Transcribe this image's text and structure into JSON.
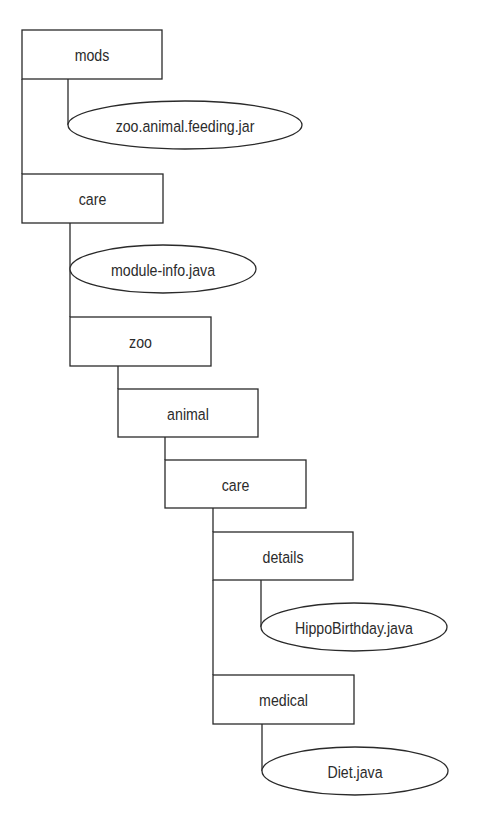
{
  "diagram": {
    "type": "directory-tree",
    "colors": {
      "stroke": "#2a2a2a",
      "text": "#2b2b2b",
      "background": "#ffffff"
    },
    "nodes": [
      {
        "id": "mods",
        "kind": "directory",
        "label": "mods",
        "x": 22,
        "y": 30,
        "w": 140,
        "h": 49
      },
      {
        "id": "zoo-animal-feeding-jar",
        "kind": "file",
        "label": "zoo.animal.feeding.jar",
        "cx": 185,
        "cy": 125,
        "rx": 117,
        "ry": 24
      },
      {
        "id": "care-root",
        "kind": "directory",
        "label": "care",
        "x": 22,
        "y": 174,
        "w": 141,
        "h": 49
      },
      {
        "id": "module-info-java",
        "kind": "file",
        "label": "module-info.java",
        "cx": 163,
        "cy": 269,
        "rx": 93,
        "ry": 24
      },
      {
        "id": "zoo",
        "kind": "directory",
        "label": "zoo",
        "x": 70,
        "y": 317,
        "w": 141,
        "h": 49
      },
      {
        "id": "animal",
        "kind": "directory",
        "label": "animal",
        "x": 118,
        "y": 389,
        "w": 140,
        "h": 48
      },
      {
        "id": "care-inner",
        "kind": "directory",
        "label": "care",
        "x": 165,
        "y": 460,
        "w": 141,
        "h": 48
      },
      {
        "id": "details",
        "kind": "directory",
        "label": "details",
        "x": 213,
        "y": 532,
        "w": 140,
        "h": 48
      },
      {
        "id": "hippo-birthday-java",
        "kind": "file",
        "label": "HippoBirthday.java",
        "cx": 354,
        "cy": 627,
        "rx": 93,
        "ry": 24
      },
      {
        "id": "medical",
        "kind": "directory",
        "label": "medical",
        "x": 213,
        "y": 675,
        "w": 141,
        "h": 49
      },
      {
        "id": "diet-java",
        "kind": "file",
        "label": "Diet.java",
        "cx": 355,
        "cy": 771,
        "rx": 93,
        "ry": 24
      }
    ],
    "edges": [
      {
        "from": "mods",
        "to": "care-root",
        "points": [
          [
            22,
            79
          ],
          [
            22,
            174
          ]
        ]
      },
      {
        "from": "mods",
        "to": "zoo-animal-feeding-jar",
        "points": [
          [
            68,
            79
          ],
          [
            68,
            125
          ]
        ]
      },
      {
        "from": "care-root",
        "to": "module-info-java",
        "points": [
          [
            70,
            223
          ],
          [
            70,
            269
          ]
        ]
      },
      {
        "from": "care-root",
        "to": "zoo",
        "points": [
          [
            70,
            269
          ],
          [
            70,
            317
          ]
        ]
      },
      {
        "from": "zoo",
        "to": "animal",
        "points": [
          [
            118,
            366
          ],
          [
            118,
            389
          ]
        ]
      },
      {
        "from": "animal",
        "to": "care-inner",
        "points": [
          [
            165,
            437
          ],
          [
            165,
            460
          ]
        ]
      },
      {
        "from": "care-inner",
        "to": "details",
        "points": [
          [
            213,
            508
          ],
          [
            213,
            532
          ]
        ]
      },
      {
        "from": "details",
        "to": "hippo-birthday-java",
        "points": [
          [
            261,
            580
          ],
          [
            261,
            627
          ]
        ]
      },
      {
        "from": "details",
        "to": "medical",
        "points": [
          [
            213,
            580
          ],
          [
            213,
            675
          ]
        ]
      },
      {
        "from": "medical",
        "to": "diet-java",
        "points": [
          [
            262,
            724
          ],
          [
            262,
            771
          ]
        ]
      }
    ]
  }
}
